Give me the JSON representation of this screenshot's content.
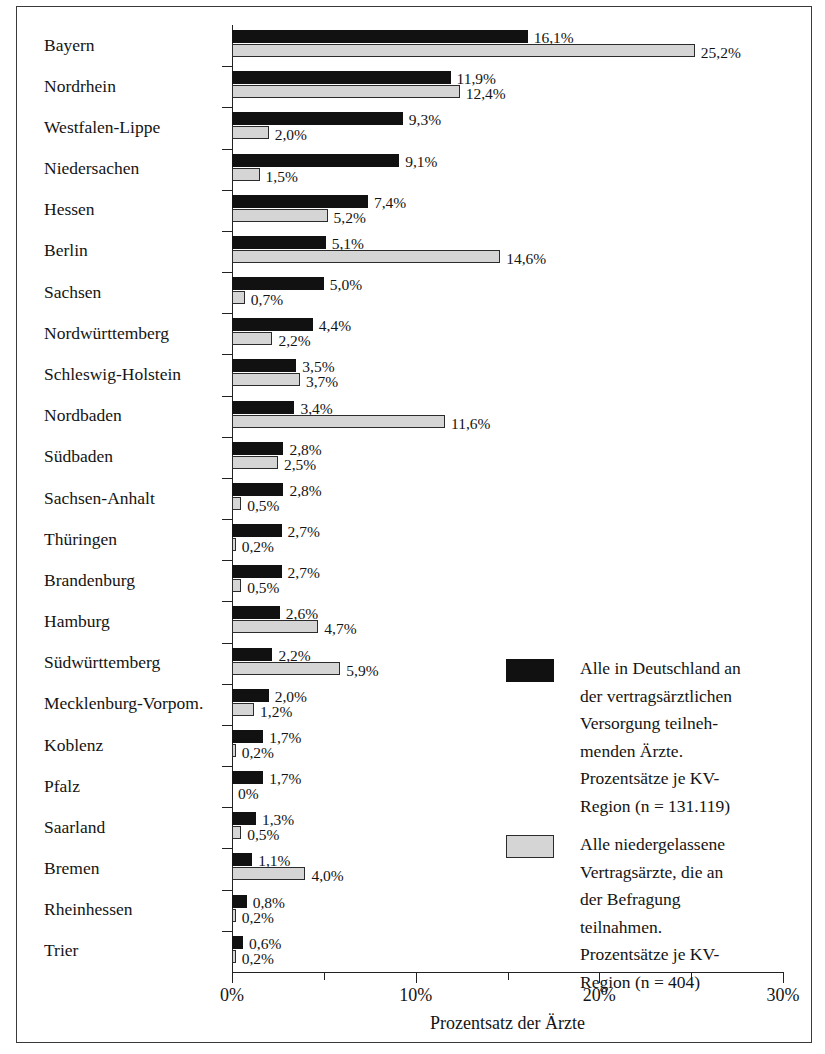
{
  "chart_data": {
    "type": "bar",
    "orientation": "horizontal",
    "title": "",
    "xlabel": "Prozentsatz der Ärzte",
    "ylabel": "",
    "xlim": [
      0,
      30
    ],
    "xunit": "%",
    "grid": false,
    "legend_position": "inside-right-lower",
    "x_ticks_major": [
      "0%",
      "10%",
      "20%",
      "30%"
    ],
    "x_tick_values_major": [
      0,
      10,
      20,
      30
    ],
    "x_tick_values_minor": [
      5,
      15,
      25
    ],
    "categories": [
      "Bayern",
      "Nordrhein",
      "Westfalen-Lippe",
      "Niedersachen",
      "Hessen",
      "Berlin",
      "Sachsen",
      "Nordwürttemberg",
      "Schleswig-Holstein",
      "Nordbaden",
      "Südbaden",
      "Sachsen-Anhalt",
      "Thüringen",
      "Brandenburg",
      "Hamburg",
      "Südwürttemberg",
      "Mecklenburg-Vorpom.",
      "Koblenz",
      "Pfalz",
      "Saarland",
      "Bremen",
      "Rheinhessen",
      "Trier"
    ],
    "series": [
      {
        "name": "Alle in Deutschland an der vertragsärztlichen Versorgung teilnehmenden Ärzte. Prozentsätze je KV-Region (n = 131.119)",
        "color": "#111111",
        "values": [
          16.1,
          11.9,
          9.3,
          9.1,
          7.4,
          5.1,
          5.0,
          4.4,
          3.5,
          3.4,
          2.8,
          2.8,
          2.7,
          2.7,
          2.6,
          2.2,
          2.0,
          1.7,
          1.7,
          1.3,
          1.1,
          0.8,
          0.6
        ],
        "labels": [
          "16,1%",
          "11,9%",
          "9,3%",
          "9,1%",
          "7,4%",
          "5,1%",
          "5,0%",
          "4,4%",
          "3,5%",
          "3,4%",
          "2,8%",
          "2,8%",
          "2,7%",
          "2,7%",
          "2,6%",
          "2,2%",
          "2,0%",
          "1,7%",
          "1,7%",
          "1,3%",
          "1,1%",
          "0,8%",
          "0,6%"
        ]
      },
      {
        "name": "Alle niedergelassene Vertragsärzte, die an der Befragung teilnahmen. Prozentsätze je KV-Region (n = 404)",
        "color": "#d5d5d5",
        "values": [
          25.2,
          12.4,
          2.0,
          1.5,
          5.2,
          14.6,
          0.7,
          2.2,
          3.7,
          11.6,
          2.5,
          0.5,
          0.2,
          0.5,
          4.7,
          5.9,
          1.2,
          0.2,
          0.0,
          0.5,
          4.0,
          0.2,
          0.2
        ],
        "labels": [
          "25,2%",
          "12,4%",
          "2,0%",
          "1,5%",
          "5,2%",
          "14,6%",
          "0,7%",
          "2,2%",
          "3,7%",
          "11,6%",
          "2,5%",
          "0,5%",
          "0,2%",
          "0,5%",
          "4,7%",
          "5,9%",
          "1,2%",
          "0,2%",
          "0%",
          "0,5%",
          "4,0%",
          "0,2%",
          "0,2%"
        ]
      }
    ]
  },
  "legend": {
    "entries": [
      {
        "swatch": "dark",
        "lines": [
          "Alle in Deutschland an",
          "der vertragsärztlichen",
          "Versorgung teilneh-",
          "menden Ärzte.",
          "Prozentsätze je KV-",
          "Region (n = 131.119)"
        ]
      },
      {
        "swatch": "light",
        "lines": [
          "Alle niedergelassene",
          "Vertragsärzte, die an",
          "der Befragung",
          "teilnahmen.",
          "Prozentsätze je KV-",
          "Region (n = 404)"
        ]
      }
    ]
  },
  "colors": {
    "dark_series": "#111111",
    "light_series": "#d5d5d5",
    "axis": "#222222",
    "frame": "#3a3a3a",
    "background": "#ffffff"
  }
}
